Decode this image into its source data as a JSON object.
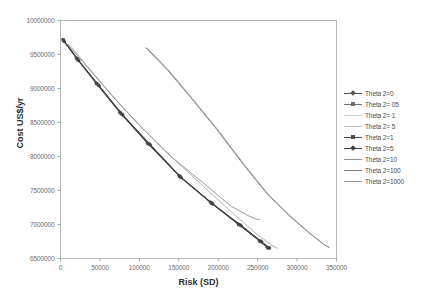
{
  "chart_data": {
    "type": "line",
    "title": "",
    "xlabel": "Risk (SD)",
    "ylabel": "Cost  US$/yr",
    "xlim": [
      0,
      350000
    ],
    "ylim": [
      6500000,
      10000000
    ],
    "xticks": [
      "0",
      "50000",
      "100000",
      "150000",
      "200000",
      "250000",
      "300000",
      "350000"
    ],
    "xtick_values": [
      0,
      50000,
      100000,
      150000,
      200000,
      250000,
      300000,
      350000
    ],
    "yticks": [
      "6500000",
      "7000000",
      "7500000",
      "8000000",
      "8500000",
      "9000000",
      "9500000",
      "10000000"
    ],
    "ytick_values": [
      6500000,
      7000000,
      7500000,
      8000000,
      8500000,
      9000000,
      9500000,
      10000000
    ],
    "grid": false,
    "legend_position": "right",
    "series": [
      {
        "name": "Theta 2=0",
        "color": "#555555",
        "marker": "diamond",
        "width": 1.0,
        "x": [
          3000,
          20000,
          45000,
          75000,
          110000,
          150000,
          190000,
          225000,
          252000,
          262000
        ],
        "y": [
          9720000,
          9450000,
          9080000,
          8650000,
          8200000,
          7720000,
          7330000,
          7010000,
          6760000,
          6660000
        ]
      },
      {
        "name": "Theta 2= 05",
        "color": "#6e6e6e",
        "marker": "square",
        "width": 1.0,
        "x": [
          4000,
          22000,
          48000,
          78000,
          113000,
          152000,
          192000,
          228000,
          254000,
          264000
        ],
        "y": [
          9700000,
          9420000,
          9050000,
          8620000,
          8180000,
          7700000,
          7310000,
          6990000,
          6750000,
          6655000
        ]
      },
      {
        "name": "Theta 2= 1",
        "color": "#d2d2d2",
        "marker": "none",
        "width": 1.0,
        "x": [
          12000,
          40000,
          70000,
          105000,
          145000,
          185000,
          220000,
          248000,
          268000,
          276000
        ],
        "y": [
          9640000,
          9250000,
          8840000,
          8400000,
          7950000,
          7520000,
          7150000,
          6870000,
          6700000,
          6650000
        ]
      },
      {
        "name": "Theta 2= 5",
        "color": "#c4c4c4",
        "marker": "none",
        "width": 1.0,
        "x": [
          10000,
          38000,
          68000,
          103000,
          143000,
          183000,
          218000,
          246000,
          266000,
          274000
        ],
        "y": [
          9650000,
          9270000,
          8860000,
          8420000,
          7970000,
          7540000,
          7170000,
          6885000,
          6705000,
          6652000
        ]
      },
      {
        "name": "Theta 2=1",
        "color": "#4b4b4b",
        "marker": "square",
        "width": 1.1,
        "x": [
          3500,
          21000,
          46000,
          76000,
          111000,
          151000,
          191000,
          226000,
          253000,
          263000
        ],
        "y": [
          9715000,
          9440000,
          9070000,
          8640000,
          8190000,
          7710000,
          7320000,
          7000000,
          6755000,
          6658000
        ]
      },
      {
        "name": "Theta 2=5",
        "color": "#3f3f3f",
        "marker": "diamond",
        "width": 1.1,
        "x": [
          5000,
          23000,
          49000,
          79000,
          114000,
          153000,
          193000,
          229000,
          255000,
          265000
        ],
        "y": [
          9690000,
          9410000,
          9040000,
          8610000,
          8170000,
          7690000,
          7300000,
          6985000,
          6748000,
          6653000
        ]
      },
      {
        "name": "Theta 2=10",
        "color": "#8f8f8f",
        "marker": "none",
        "width": 0.9,
        "x": [
          8000,
          35000,
          65000,
          100000,
          140000,
          180000,
          215000,
          238000,
          248000,
          252000
        ],
        "y": [
          9660000,
          9300000,
          8900000,
          8460000,
          8000000,
          7620000,
          7280000,
          7130000,
          7080000,
          7075000
        ]
      },
      {
        "name": "Theta 2=100",
        "color": "#7d7d7d",
        "marker": "none",
        "width": 0.9,
        "x": [
          108000,
          135000,
          165000,
          198000,
          232000,
          262000,
          290000,
          315000,
          334000,
          340000
        ],
        "y": [
          9600000,
          9280000,
          8870000,
          8400000,
          7880000,
          7450000,
          7130000,
          6880000,
          6705000,
          6665000
        ]
      },
      {
        "name": "Theta 2=1000",
        "color": "#909090",
        "marker": "none",
        "width": 0.9,
        "x": [
          110000,
          137000,
          167000,
          200000,
          234000,
          264000,
          292000,
          316000,
          335000,
          341000
        ],
        "y": [
          9595000,
          9270000,
          8855000,
          8385000,
          7865000,
          7435000,
          7120000,
          6872000,
          6700000,
          6660000
        ]
      }
    ]
  },
  "axes": {
    "frame_color": "#b8b8b8",
    "tick_color": "#a8a8a8",
    "label_color": "#6b6b6b"
  }
}
